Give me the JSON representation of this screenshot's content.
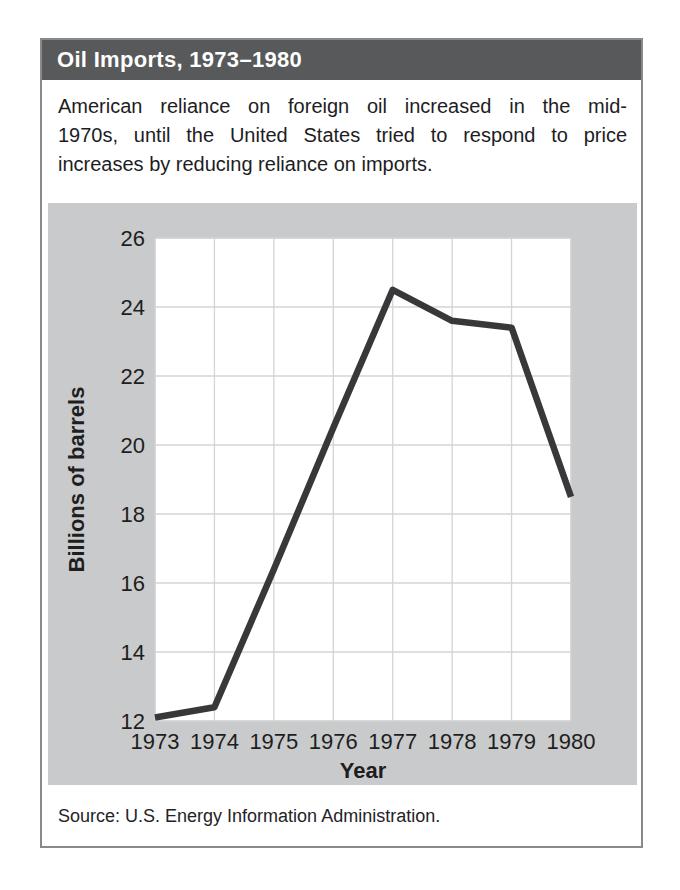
{
  "card": {
    "title": "Oil Imports, 1973–1980",
    "description_lines": [
      "American reliance on foreign oil increased in the mid-",
      "1970s, until the United States tried to respond to price",
      "increases by reducing reliance on imports."
    ],
    "source": "Source: U.S. Energy Information Administration."
  },
  "chart_data": {
    "type": "line",
    "title": "Oil Imports, 1973–1980",
    "x": [
      1973,
      1974,
      1975,
      1976,
      1977,
      1978,
      1979,
      1980
    ],
    "series": [
      {
        "name": "Oil imports",
        "values": [
          12.1,
          12.4,
          16.4,
          20.5,
          24.5,
          23.6,
          23.4,
          18.5
        ]
      }
    ],
    "xlabel": "Year",
    "ylabel": "Billions of barrels",
    "ylim": [
      12,
      26
    ],
    "yticks": [
      12,
      14,
      16,
      18,
      20,
      22,
      24,
      26
    ],
    "grid": true,
    "legend_position": "none",
    "line_color": "#38383b",
    "plot_bg": "#ffffff",
    "panel_bg": "#c9cacb",
    "gridline_color": "#d3d4d5"
  }
}
